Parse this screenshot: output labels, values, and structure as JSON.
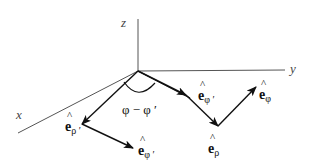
{
  "diagram": {
    "axes": {
      "x": "x",
      "y": "y",
      "z": "z"
    },
    "angle_label": "φ − φ ′",
    "vectors": {
      "e_rho_prime": {
        "base": "e",
        "hat": "^",
        "sub": "ρ ′"
      },
      "e_phi_prime_lower": {
        "base": "e",
        "hat": "^",
        "sub": "φ ′"
      },
      "e_phi_prime_origin": {
        "base": "e",
        "hat": "^",
        "sub": "φ ′"
      },
      "e_rho": {
        "base": "e",
        "hat": "^",
        "sub": "ρ"
      },
      "e_phi": {
        "base": "e",
        "hat": "^",
        "sub": "φ"
      }
    },
    "colors": {
      "axis": "#555555",
      "vector": "#111111",
      "background": "#ffffff"
    }
  }
}
